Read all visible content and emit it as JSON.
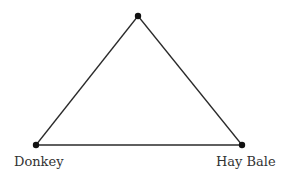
{
  "diagram": {
    "type": "triangle",
    "stroke_color": "#2a2a2a",
    "vertex_color": "#111111",
    "label_color": "#333333",
    "vertices": [
      {
        "id": "top",
        "label": "",
        "x": 138,
        "y": 16
      },
      {
        "id": "donkey",
        "label": "Donkey",
        "x": 36,
        "y": 145
      },
      {
        "id": "hay-bale",
        "label": "Hay Bale",
        "x": 242,
        "y": 145
      }
    ],
    "edges": [
      {
        "from": "top",
        "to": "donkey"
      },
      {
        "from": "top",
        "to": "hay-bale"
      },
      {
        "from": "donkey",
        "to": "hay-bale"
      }
    ],
    "labels": {
      "donkey": "Donkey",
      "hay_bale": "Hay Bale"
    }
  }
}
